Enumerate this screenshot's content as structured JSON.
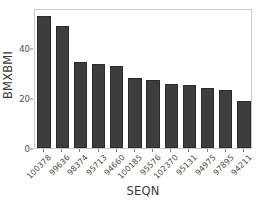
{
  "chart_data": {
    "type": "bar",
    "title": "",
    "xlabel": "SEQN",
    "ylabel": "BMXBMI",
    "categories": [
      "100378",
      "99636",
      "98374",
      "95713",
      "94660",
      "100185",
      "95576",
      "102370",
      "95131",
      "94975",
      "97895",
      "94211"
    ],
    "values": [
      53.0,
      49.0,
      34.5,
      33.7,
      33.0,
      28.0,
      27.2,
      25.5,
      25.3,
      24.1,
      23.2,
      19.0
    ],
    "ylim": [
      0,
      56
    ],
    "yticks": [
      0,
      20,
      40
    ],
    "ytick_labels": [
      "0",
      "20",
      "40"
    ],
    "grid": false,
    "legend": null,
    "bar_color": "#3d3d3d",
    "bar_border_color": "#2b2b2b",
    "panel_border_color": "#c8c8c8",
    "axis_text_color": "#4d4d4d",
    "background": "#ffffff",
    "xtick_rotation_deg": -45
  }
}
